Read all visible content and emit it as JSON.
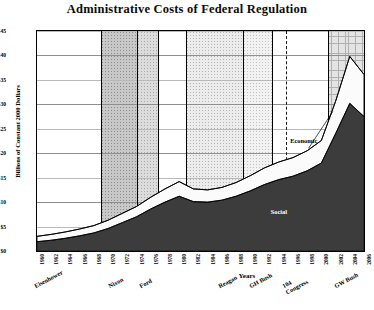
{
  "chart_data": {
    "type": "area",
    "title": "Administrative Costs of Federal Regulation",
    "xlabel": "Years",
    "ylabel": "Billions of Constant 2000 Dollars",
    "ylim": [
      0,
      45
    ],
    "ytick_labels": [
      "$0",
      "$5",
      "$10",
      "$15",
      "$20",
      "$25",
      "$30",
      "$35",
      "$40",
      "$45"
    ],
    "ytick_values": [
      0,
      5,
      10,
      15,
      20,
      25,
      30,
      35,
      40,
      45
    ],
    "grid": true,
    "legend_position": "inline-annotations",
    "stacked": true,
    "x": [
      1960,
      1962,
      1964,
      1966,
      1968,
      1970,
      1972,
      1974,
      1976,
      1978,
      1980,
      1982,
      1984,
      1986,
      1988,
      1990,
      1992,
      1994,
      1996,
      1998,
      2000,
      2002,
      2004,
      2006
    ],
    "xtick_labels": [
      "1960",
      "1962",
      "1964",
      "1966",
      "1968",
      "1970",
      "1972",
      "1974",
      "1976",
      "1978",
      "1980",
      "1982",
      "1984",
      "1986",
      "1988",
      "1990",
      "1992",
      "1994",
      "1996",
      "1998",
      "2000",
      "2002",
      "2004",
      "2006"
    ],
    "series": [
      {
        "name": "Social",
        "values": [
          1.9,
          2.2,
          2.6,
          3.1,
          3.7,
          4.6,
          5.8,
          7.0,
          8.6,
          10.0,
          11.2,
          10.1,
          10.0,
          10.4,
          11.2,
          12.3,
          13.6,
          14.6,
          15.3,
          16.4,
          18.0,
          24.0,
          30.2,
          27.5
        ]
      },
      {
        "name": "Economic",
        "values": [
          1.1,
          1.2,
          1.3,
          1.4,
          1.5,
          1.7,
          1.9,
          2.1,
          2.4,
          2.7,
          3.0,
          2.6,
          2.5,
          2.6,
          2.8,
          3.1,
          3.4,
          3.6,
          3.8,
          4.1,
          4.6,
          6.6,
          9.6,
          8.6
        ]
      }
    ],
    "total_values": [
      3.0,
      3.4,
      3.9,
      4.5,
      5.2,
      6.3,
      7.7,
      9.1,
      11.0,
      12.7,
      14.2,
      12.7,
      12.5,
      13.0,
      14.0,
      15.4,
      17.0,
      18.2,
      19.1,
      20.5,
      22.6,
      30.6,
      39.8,
      36.1
    ],
    "annotations": [
      {
        "text": "Economic",
        "x": 1999,
        "y": 22.5
      },
      {
        "text": "Social",
        "x": 1994,
        "y": 8.0
      }
    ],
    "eras": [
      {
        "label": "Eisenhower",
        "start": 1960,
        "end": 1961,
        "shade": "none"
      },
      {
        "label": "Nixon",
        "start": 1969,
        "end": 1974,
        "shade": "shade-a"
      },
      {
        "label": "Ford",
        "start": 1974,
        "end": 1977,
        "shade": "shade-b"
      },
      {
        "label": "Reagan",
        "start": 1981,
        "end": 1989,
        "shade": "shade-c"
      },
      {
        "label": "GH Bush",
        "start": 1989,
        "end": 1993,
        "shade": "shade-e"
      },
      {
        "label": "104 Congress",
        "start": 1995,
        "end": 1995,
        "shade": "none"
      },
      {
        "label": "GW Bush",
        "start": 2001,
        "end": 2006,
        "shade": "shade-d"
      }
    ]
  }
}
